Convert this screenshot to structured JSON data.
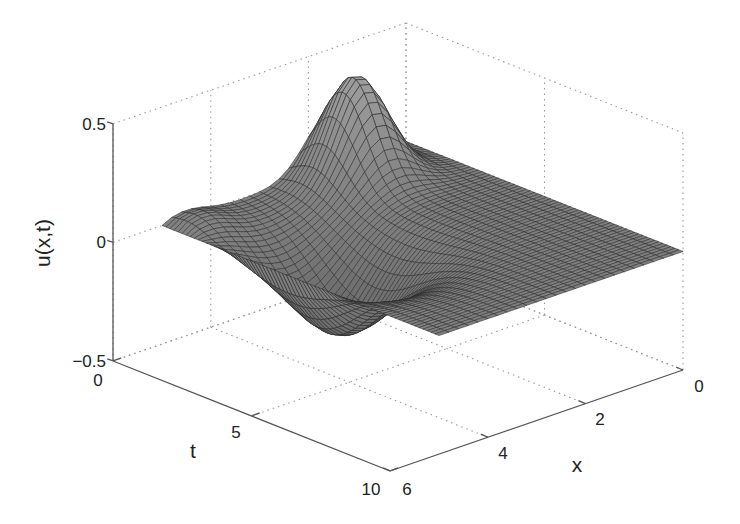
{
  "chart_data": {
    "type": "surface",
    "title": "",
    "xlabel": "x",
    "ylabel": "t",
    "zlabel": "u(x,t)",
    "x_range": [
      0,
      6
    ],
    "t_range": [
      0,
      10
    ],
    "z_range": [
      -0.5,
      0.5
    ],
    "x_ticks": [
      "0",
      "2",
      "4",
      "6"
    ],
    "t_ticks": [
      "0",
      "5",
      "10"
    ],
    "z_ticks": [
      "-0.5",
      "0",
      "0.5"
    ],
    "grid": true,
    "surface_domain": {
      "x": [
        0,
        5
      ],
      "t": [
        0,
        10
      ]
    },
    "features": {
      "peak": {
        "x": 1.5,
        "t": 0.8,
        "u": 0.43
      },
      "trough": {
        "x": 3.8,
        "t": 4.0,
        "u": -0.36
      },
      "boundary_value": 0
    },
    "colors": {
      "face": "#8c8c8c",
      "edge": "#2a2a2a",
      "axis": "#555555",
      "grid": "#9a9a9a"
    }
  },
  "axes": {
    "zlabel": "u(x,t)",
    "tlabel": "t",
    "xlabel": "x",
    "z_tick_labels": [
      "0.5",
      "0",
      "−0.5"
    ],
    "t_tick_labels": [
      "0",
      "5",
      "10"
    ],
    "x_tick_labels": [
      "0",
      "2",
      "4",
      "6"
    ]
  }
}
